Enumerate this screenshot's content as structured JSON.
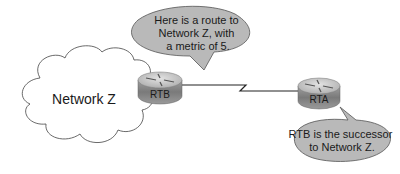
{
  "diagram": {
    "cloud": {
      "label": "Network Z"
    },
    "routers": [
      {
        "id": "rtb",
        "label": "RTB"
      },
      {
        "id": "rta",
        "label": "RTA"
      }
    ],
    "link": {
      "type": "serial"
    },
    "callouts": [
      {
        "id": "rtb-callout",
        "lines": [
          "Here is a route to",
          "Network Z, with",
          "a metric of 5."
        ]
      },
      {
        "id": "rta-callout",
        "lines": [
          "RTB is the successor",
          "to Network Z."
        ]
      }
    ],
    "colors": {
      "bubble_fill": "#b9b9b9",
      "bubble_stroke": "#555555",
      "router_top": "#c8c8c8",
      "router_side": "#8a8a8a",
      "line": "#222222"
    }
  }
}
